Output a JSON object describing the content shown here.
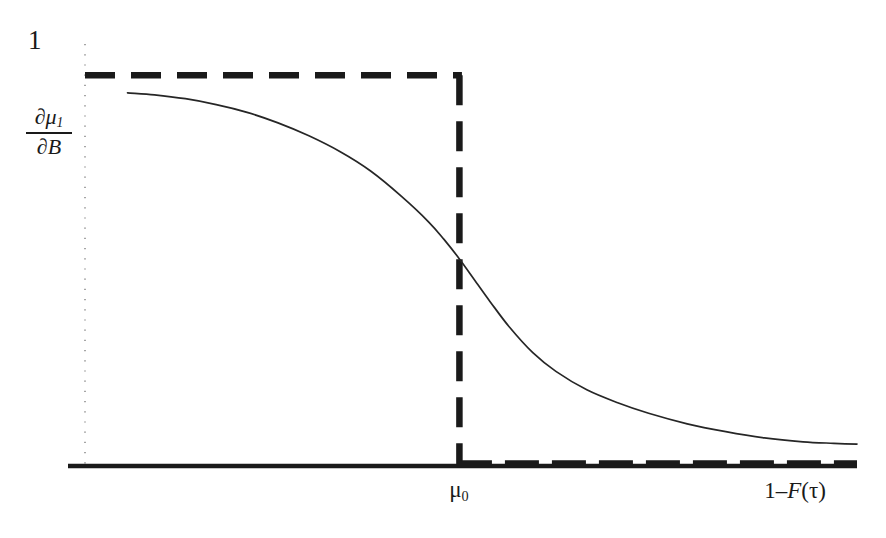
{
  "chart_data": {
    "type": "line",
    "title": "",
    "subtitle": "",
    "xlabel": "1−F(τ)",
    "ylabel": "∂μ₁/∂B",
    "ylabel_numerator": "∂μ",
    "ylabel_numerator_sub": "1",
    "ylabel_denominator": "∂B",
    "xlabel_prefix": "1–",
    "xlabel_function": "F",
    "xlabel_arg": "(τ)",
    "grid": false,
    "legend": "none",
    "xlim": [
      0,
      1
    ],
    "ylim": [
      0,
      1.08
    ],
    "x_tick_labels": [
      "μ₀"
    ],
    "x_tick_values": [
      0.485
    ],
    "x_tick_label_mu0": "μ",
    "x_tick_label_mu0_sub": "0",
    "y_tick_labels": [
      "1"
    ],
    "y_tick_values": [
      1
    ],
    "y_tick_label_one": "1",
    "series": [
      {
        "name": "smooth-response",
        "style": "solid-thin",
        "color": "#1a1a1a",
        "description": "Smooth decreasing sigmoid of the marginal effect",
        "x": [
          0.055,
          0.09,
          0.13,
          0.17,
          0.21,
          0.25,
          0.29,
          0.33,
          0.37,
          0.41,
          0.445,
          0.465,
          0.485,
          0.505,
          0.525,
          0.55,
          0.58,
          0.61,
          0.65,
          0.69,
          0.73,
          0.78,
          0.83,
          0.88,
          0.93,
          0.97,
          1.0
        ],
        "y": [
          0.955,
          0.95,
          0.94,
          0.925,
          0.905,
          0.878,
          0.845,
          0.805,
          0.755,
          0.69,
          0.625,
          0.58,
          0.53,
          0.475,
          0.42,
          0.355,
          0.29,
          0.242,
          0.195,
          0.162,
          0.135,
          0.108,
          0.088,
          0.072,
          0.062,
          0.058,
          0.056
        ]
      },
      {
        "name": "step-benchmark",
        "style": "dashed-thick",
        "color": "#1a1a1a",
        "description": "Dashed step function equal to 1 up to mu0 then 0 afterwards",
        "x": [
          0.0,
          0.485,
          0.485,
          1.0
        ],
        "y": [
          1.0,
          1.0,
          0.0,
          0.0
        ]
      }
    ],
    "annotations": [
      {
        "name": "y-axis-dotted",
        "text": "",
        "style": "dotted-vertical"
      },
      {
        "name": "x-axis-solid",
        "text": "",
        "style": "solid-horizontal"
      }
    ]
  },
  "axes": {
    "y_top_value": "1",
    "x_threshold_value": "μ₀",
    "x_axis_name": "1–F(τ)"
  },
  "colors": {
    "ink": "#1a1a1a",
    "background": "#ffffff",
    "curve": "#2a2a2a",
    "dotted_axis": "#8a8a8a"
  }
}
